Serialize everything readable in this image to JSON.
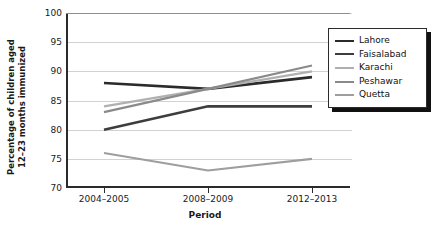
{
  "chart_data": {
    "type": "line",
    "title": "",
    "xlabel": "Period",
    "ylabel": "Percentage of children aged 12–23 months immunized",
    "ylabel_line1": "Percentage of children aged",
    "ylabel_line2": "12–23 months immunized",
    "categories": [
      "2004–2005",
      "2008–2009",
      "2012–2013"
    ],
    "ylim": [
      70,
      100
    ],
    "yticks": [
      70,
      75,
      80,
      85,
      90,
      95,
      100
    ],
    "ytick_labels": [
      "70",
      "75",
      "80",
      "85",
      "90",
      "95",
      "100"
    ],
    "grid": true,
    "legend_position": "right-inside",
    "series": [
      {
        "name": "Lahore",
        "values": [
          88,
          87,
          89
        ],
        "color": "#2b2b2b",
        "width": 2.6
      },
      {
        "name": "Faisalabad",
        "values": [
          80,
          84,
          84
        ],
        "color": "#3d3d3d",
        "width": 2.6
      },
      {
        "name": "Karachi",
        "values": [
          84,
          87,
          90
        ],
        "color": "#b0b0b0",
        "width": 2.2
      },
      {
        "name": "Peshawar",
        "values": [
          83,
          87,
          91
        ],
        "color": "#8a8a8a",
        "width": 2.2
      },
      {
        "name": "Quetta",
        "values": [
          76,
          73,
          75
        ],
        "color": "#9e9e9e",
        "width": 2.2
      }
    ]
  },
  "axis": {
    "x_title": "Period",
    "y_title_line1": "Percentage of children aged",
    "y_title_line2": "12–23 months immunized"
  },
  "legend": {
    "entries": [
      {
        "label": "Lahore",
        "color": "#2b2b2b",
        "width": 2.6
      },
      {
        "label": "Faisalabad",
        "color": "#3d3d3d",
        "width": 2.8
      },
      {
        "label": "Karachi",
        "color": "#b0b0b0",
        "width": 2.2
      },
      {
        "label": "Peshawar",
        "color": "#8a8a8a",
        "width": 2.2
      },
      {
        "label": "Quetta",
        "color": "#9e9e9e",
        "width": 2.2
      }
    ]
  },
  "colors": {
    "axis": "#2b2b2b",
    "grid": "#d2d2d2",
    "text": "#1a1a1a",
    "background": "#ffffff",
    "legend_border": "#2b2b2b",
    "legend_shadow": "#111111"
  }
}
